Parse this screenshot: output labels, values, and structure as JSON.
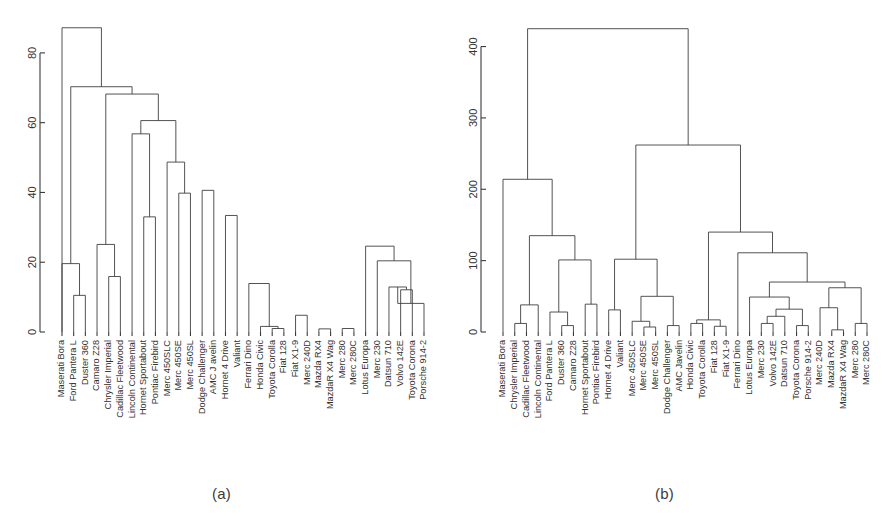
{
  "figure": {
    "background": "#ffffff",
    "line_color": "#3f3f3f",
    "text_color": "#333333"
  },
  "panels": [
    {
      "id": "a",
      "caption": "(a)"
    },
    {
      "id": "b",
      "caption": "(b)"
    }
  ],
  "chart_data": [
    {
      "type": "dendrogram",
      "panel": "(a)",
      "title": "",
      "xlabel": "",
      "ylabel": "",
      "ylim": [
        0,
        90
      ],
      "grid": false,
      "legend": "none",
      "yticks": [
        0,
        20,
        40,
        60,
        80
      ],
      "ytick_labels": [
        "0",
        "20",
        "40",
        "60",
        "80"
      ],
      "leaf_labels": [
        "Maserati Bora",
        "Ford Pantera L",
        "Duster 360",
        "Camaro Z28",
        "Chrysler Imperial",
        "Cadillac Fleetwood",
        "Lincoln Continental",
        "Hornet Sportabout",
        "Pontiac Firebird",
        "Merc 450SLC",
        "Merc 450SE",
        "Merc 450SL",
        "Dodge Challenger",
        "AMC J avelin",
        "Hornet 4 Drive",
        "Valiant",
        "Ferrari Dino",
        "Honda Civic",
        "Toyota Corolla",
        "Fiat 128",
        "Fiat X1-9",
        "Merc 240D",
        "Mazda RX4",
        "MazdaR X4 Wag",
        "Merc 280",
        "Merc 280C",
        "Lotus Europa",
        "Merc 230",
        "Datsun 710",
        "Volvo 142E",
        "Toyota Corona",
        "Porsche 914-2"
      ],
      "merges": [
        {
          "left": 1,
          "right": 2,
          "height": 10.5
        },
        {
          "left": 0,
          "right": -1,
          "height": 19.6
        },
        {
          "left": 4,
          "right": 5,
          "height": 15.9
        },
        {
          "left": 3,
          "right": -3,
          "height": 25.1
        },
        {
          "left": 18,
          "right": 19,
          "height": 1.0
        },
        {
          "left": 17,
          "right": -5,
          "height": 1.6
        },
        {
          "left": 20,
          "right": 21,
          "height": 4.8
        },
        {
          "left": 22,
          "right": 23,
          "height": 0.9
        },
        {
          "left": 24,
          "right": 25,
          "height": 1.0
        },
        {
          "left": 29,
          "right": 30,
          "height": 12.1
        },
        {
          "left": 28,
          "right": -10,
          "height": 12.9
        },
        {
          "left": 31,
          "right": -11,
          "height": 8.2
        },
        {
          "left": 27,
          "right": -12,
          "height": 20.4
        },
        {
          "left": 26,
          "right": -13,
          "height": 24.6
        },
        {
          "left": 16,
          "right": -6,
          "height": 13.9
        },
        {
          "left": 15,
          "right": 14,
          "height": 33.4
        },
        {
          "left": 13,
          "right": 12,
          "height": 40.6
        },
        {
          "left": 11,
          "right": 10,
          "height": 39.8
        },
        {
          "left": 9,
          "right": -18,
          "height": 48.7
        },
        {
          "left": 8,
          "right": 7,
          "height": 33.0
        },
        {
          "left": 6,
          "right": -20,
          "height": 56.8
        },
        {
          "left": -19,
          "right": -21,
          "height": 60.6
        },
        {
          "left": -4,
          "right": -22,
          "height": 68.2
        },
        {
          "left": -2,
          "right": -23,
          "height": 70.3
        },
        {
          "left": -24,
          "right": 0,
          "height": 87.2
        }
      ],
      "nodes_px_hint": "heights read from y-axis gridless ticks 0..80"
    },
    {
      "type": "dendrogram",
      "panel": "(b)",
      "title": "",
      "xlabel": "",
      "ylabel": "",
      "ylim": [
        0,
        440
      ],
      "grid": false,
      "legend": "none",
      "yticks": [
        0,
        100,
        200,
        300,
        400
      ],
      "ytick_labels": [
        "0",
        "100",
        "200",
        "300",
        "400"
      ],
      "leaf_labels": [
        "Maserati Bora",
        "Chrysler Imperial",
        "Cadillac Fleetwood",
        "Lincoln Continental",
        "Ford Pantera L",
        "Duster 360",
        "Camaro Z28",
        "Hornet Sportabout",
        "Pontiac Firebird",
        "Hornet 4 Drive",
        "Valiant",
        "Merc 450SLC",
        "Merc 450SE",
        "Merc 450SL",
        "Dodge Challenger",
        "AMC Javelin",
        "Honda Civic",
        "Toyota Corolla",
        "Fiat 128",
        "Fiat X1-9",
        "Ferrari Dino",
        "Lotus Europa",
        "Merc 230",
        "Volvo 142E",
        "Datsun 710",
        "Toyota Corona",
        "Porsche 914-2",
        "Merc 240D",
        "Mazda RX4",
        "MazdaR X4 Wag",
        "Merc 280",
        "Merc 280C"
      ],
      "merges": [
        {
          "left": 1,
          "right": 2,
          "height": 12.0
        },
        {
          "left": 3,
          "right": -1,
          "height": 38.0
        },
        {
          "left": 5,
          "right": 6,
          "height": 9.0
        },
        {
          "left": 4,
          "right": -3,
          "height": 28.0
        },
        {
          "left": 7,
          "right": 8,
          "height": 39.0
        },
        {
          "left": -4,
          "right": -5,
          "height": 101.0
        },
        {
          "left": -2,
          "right": -6,
          "height": 135.0
        },
        {
          "left": 0,
          "right": -7,
          "height": 214.0
        },
        {
          "left": 9,
          "right": 10,
          "height": 31.0
        },
        {
          "left": 12,
          "right": 13,
          "height": 7.0
        },
        {
          "left": 11,
          "right": -10,
          "height": 15.0
        },
        {
          "left": 14,
          "right": 15,
          "height": 9.0
        },
        {
          "left": -11,
          "right": -12,
          "height": 50.0
        },
        {
          "left": -9,
          "right": -13,
          "height": 102.0
        },
        {
          "left": 16,
          "right": 17,
          "height": 12.0
        },
        {
          "left": 18,
          "right": 19,
          "height": 8.0
        },
        {
          "left": -15,
          "right": -16,
          "height": 17.0
        },
        {
          "left": 22,
          "right": 23,
          "height": 12.0
        },
        {
          "left": 24,
          "right": -18,
          "height": 22.0
        },
        {
          "left": 25,
          "right": 26,
          "height": 9.0
        },
        {
          "left": -19,
          "right": -20,
          "height": 32.0
        },
        {
          "left": 21,
          "right": -21,
          "height": 49.0
        },
        {
          "left": 28,
          "right": 29,
          "height": 3.0
        },
        {
          "left": 30,
          "right": 31,
          "height": 12.0
        },
        {
          "left": 27,
          "right": -23,
          "height": 34.0
        },
        {
          "left": -25,
          "right": -24,
          "height": 62.0
        },
        {
          "left": -22,
          "right": -26,
          "height": 70.0
        },
        {
          "left": 20,
          "right": -27,
          "height": 111.0
        },
        {
          "left": -17,
          "right": -28,
          "height": 140.0
        },
        {
          "left": -14,
          "right": -29,
          "height": 262.0
        },
        {
          "left": -8,
          "right": -30,
          "height": 425.0
        }
      ],
      "nodes_px_hint": "heights read from y-axis gridless ticks 0..400"
    }
  ]
}
